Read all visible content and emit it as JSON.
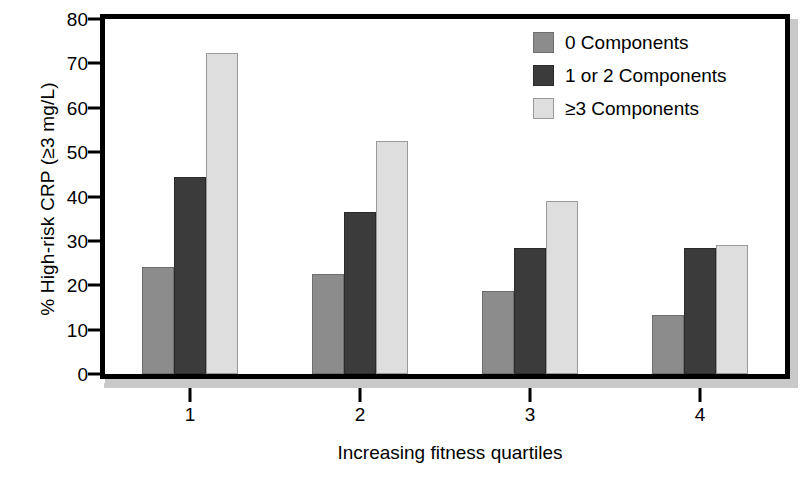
{
  "chart_data": {
    "type": "bar",
    "title": "",
    "subtitle": "",
    "xlabel": "Increasing fitness quartiles",
    "ylabel": "% High-risk CRP (≥3 mg/L)",
    "categories": [
      "1",
      "2",
      "3",
      "4"
    ],
    "series": [
      {
        "name": "0 Components",
        "color": "#8c8c8c",
        "values": [
          24.2,
          22.6,
          18.6,
          13.2
        ]
      },
      {
        "name": "1 or 2 Components",
        "color": "#3b3b3b",
        "values": [
          44.3,
          36.6,
          28.5,
          28.3
        ]
      },
      {
        "name": "≥3 Components",
        "color": "#dedede",
        "values": [
          72.4,
          52.5,
          38.9,
          29.0
        ]
      }
    ],
    "ylim": [
      0,
      80
    ],
    "yticks": [
      0,
      10,
      20,
      30,
      40,
      50,
      60,
      70,
      80
    ],
    "ytick_labels": [
      "0",
      "10",
      "20",
      "30",
      "40",
      "50",
      "60",
      "70",
      "80"
    ],
    "grid": false,
    "legend_position": "top-right",
    "legend_entries": [
      "0 Components",
      "1 or 2 Components",
      "≥3 Components"
    ]
  }
}
